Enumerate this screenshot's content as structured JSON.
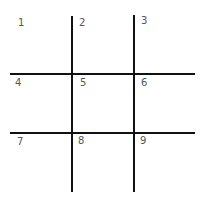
{
  "grid": {
    "cells": [
      "1",
      "2",
      "3",
      "4",
      "5",
      "6",
      "7",
      "8",
      "9"
    ],
    "line_color": "#111111",
    "text_color": "#555555"
  }
}
